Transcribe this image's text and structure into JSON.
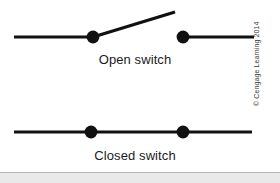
{
  "figure": {
    "background_color": "#ffffff",
    "ink_color": "#111111",
    "captions": {
      "open": "Open switch",
      "closed": "Closed switch"
    },
    "credit": "© Cengage Learning 2014"
  },
  "chart_data": {
    "type": "diagram",
    "title": "",
    "subtitle": "",
    "xlabel": "",
    "ylabel": "",
    "grid": false,
    "legend": "none",
    "canvas": {
      "width": 280,
      "height": 183
    },
    "annotations": [
      {
        "text": "Open switch",
        "x": 135,
        "y": 60
      },
      {
        "text": "Closed switch",
        "x": 135,
        "y": 157
      },
      {
        "text": "© Cengage Learning 2014",
        "x": 266,
        "y": 128,
        "rotation": -90
      }
    ],
    "series": [
      {
        "name": "open-switch",
        "label": "Open switch",
        "state": "open",
        "stroke_width": 3.2,
        "segments": [
          {
            "name": "left-lead",
            "x1": 14,
            "y1": 37,
            "x2": 93,
            "y2": 37
          },
          {
            "name": "lever-arm",
            "x1": 93,
            "y1": 37,
            "x2": 175,
            "y2": 12
          },
          {
            "name": "right-lead",
            "x1": 183,
            "y1": 37,
            "x2": 254,
            "y2": 37
          }
        ],
        "nodes": [
          {
            "name": "pivot-terminal",
            "cx": 93,
            "cy": 37,
            "r": 6.4
          },
          {
            "name": "contact-terminal",
            "cx": 183,
            "cy": 37,
            "r": 6.4
          }
        ]
      },
      {
        "name": "closed-switch",
        "label": "Closed switch",
        "state": "closed",
        "stroke_width": 3.2,
        "segments": [
          {
            "name": "conductor",
            "x1": 14,
            "y1": 132,
            "x2": 252,
            "y2": 132
          }
        ],
        "nodes": [
          {
            "name": "pivot-terminal",
            "cx": 91,
            "cy": 132,
            "r": 6.4
          },
          {
            "name": "contact-terminal",
            "cx": 183,
            "cy": 132,
            "r": 6.4
          }
        ]
      }
    ]
  }
}
